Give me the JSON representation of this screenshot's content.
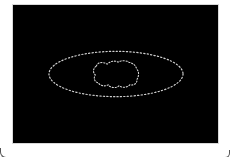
{
  "image": {
    "background_color": "#000000",
    "frame_color": "#ffffff",
    "contour_color": "#d0d0d0",
    "contours": [
      {
        "name": "outer-ellipse",
        "shape": "ellipse",
        "cx": 104,
        "cy": 70,
        "rx": 68,
        "ry": 23
      },
      {
        "name": "inner-blob",
        "shape": "irregular",
        "cx": 104,
        "cy": 70,
        "w": 46,
        "h": 30
      }
    ]
  }
}
